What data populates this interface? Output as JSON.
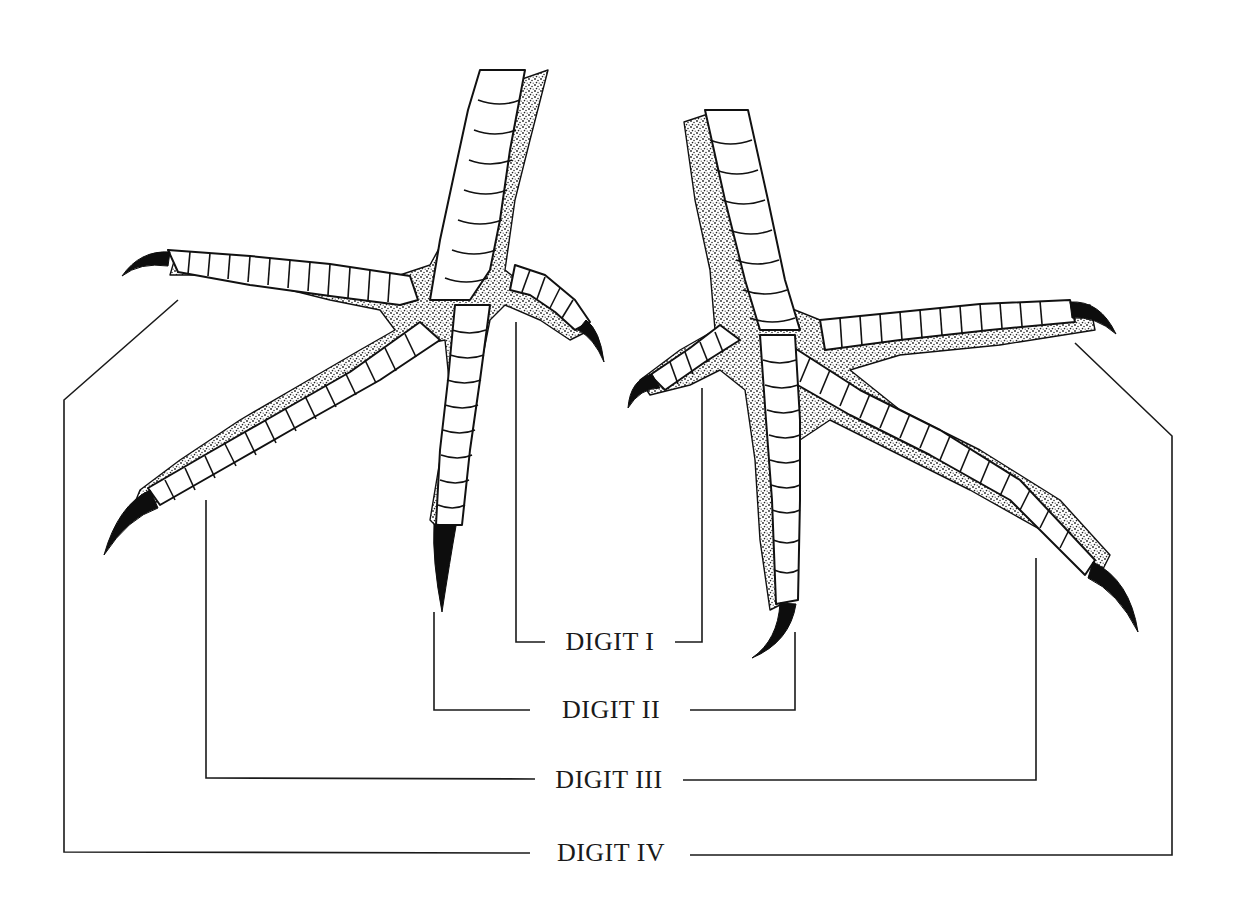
{
  "figure": {
    "colors": {
      "ink": "#111111",
      "paper": "#ffffff",
      "stipple": "#555555"
    }
  },
  "labels": [
    {
      "id": "digit-1",
      "text": "DIGIT I",
      "x": 610,
      "y": 625
    },
    {
      "id": "digit-2",
      "text": "DIGIT II",
      "x": 611,
      "y": 697
    },
    {
      "id": "digit-3",
      "text": "DIGIT III",
      "x": 609,
      "y": 767
    },
    {
      "id": "digit-4",
      "text": "DIGIT IV",
      "x": 611,
      "y": 838
    }
  ]
}
